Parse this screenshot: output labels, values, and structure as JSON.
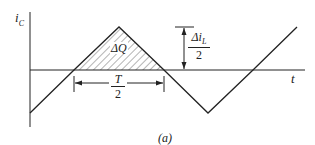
{
  "diagram": {
    "y_axis_label": "i",
    "y_axis_label_sub": "C",
    "x_axis_label": "t",
    "area_label": "ΔQ",
    "ripple_label_num": "Δi",
    "ripple_label_num_sub": "L",
    "ripple_label_den": "2",
    "period_label_num": "T",
    "period_label_den": "2",
    "caption": "(a)",
    "colors": {
      "line": "#222222",
      "hatch": "#444444",
      "background": "#ffffff"
    }
  }
}
